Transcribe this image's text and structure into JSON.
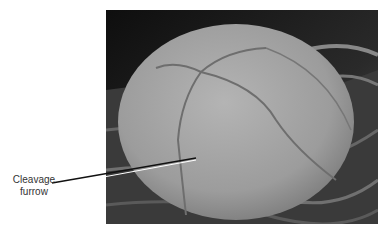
{
  "figure": {
    "annotation": {
      "line1": "Cleavage",
      "line2": "furrow"
    },
    "colors": {
      "background": "#1c1c1c",
      "cell": "#a8a8a8",
      "label_text": "#333333"
    }
  }
}
